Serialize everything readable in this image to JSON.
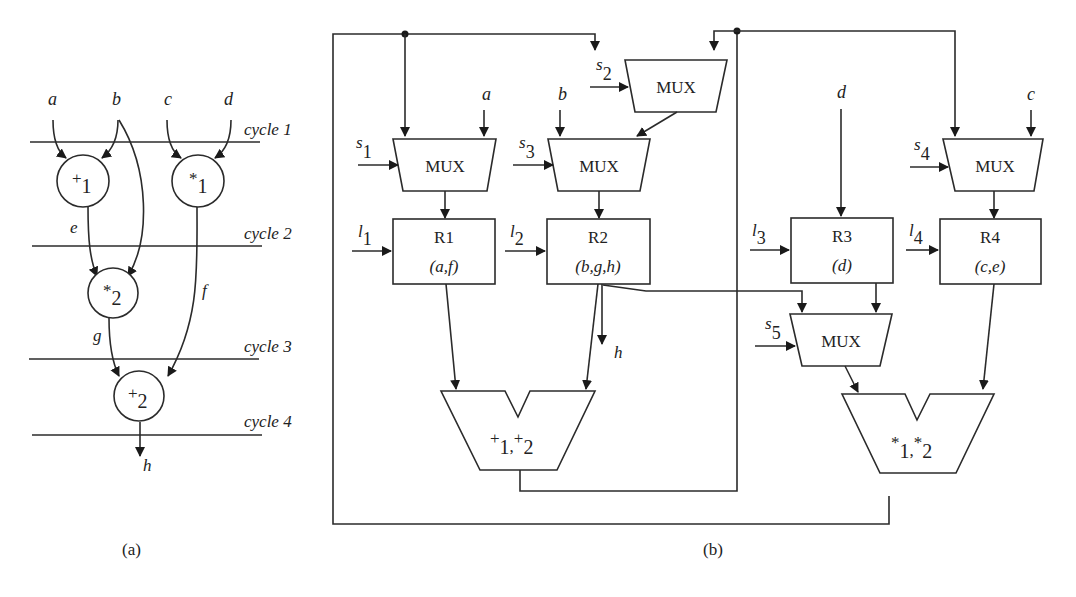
{
  "figure_a": {
    "caption": "(a)",
    "inputs": [
      "a",
      "b",
      "c",
      "d"
    ],
    "cycles": [
      "cycle 1",
      "cycle 2",
      "cycle 3",
      "cycle 4"
    ],
    "nodes": [
      {
        "op": "+",
        "sub": "1"
      },
      {
        "op": "*",
        "sub": "1"
      },
      {
        "op": "*",
        "sub": "2"
      },
      {
        "op": "+",
        "sub": "2"
      }
    ],
    "edge_labels": {
      "e": "e",
      "f": "f",
      "g": "g",
      "h": "h"
    }
  },
  "figure_b": {
    "caption": "(b)",
    "muxes": [
      {
        "label": "MUX",
        "select": "s",
        "select_sub": "1"
      },
      {
        "label": "MUX",
        "select": "s",
        "select_sub": "2"
      },
      {
        "label": "MUX",
        "select": "s",
        "select_sub": "3"
      },
      {
        "label": "MUX",
        "select": "s",
        "select_sub": "4"
      },
      {
        "label": "MUX",
        "select": "s",
        "select_sub": "5"
      }
    ],
    "registers": [
      {
        "name": "R1",
        "contents": "(a,f)",
        "load": "l",
        "load_sub": "1"
      },
      {
        "name": "R2",
        "contents": "(b,g,h)",
        "load": "l",
        "load_sub": "2"
      },
      {
        "name": "R3",
        "contents": "(d)",
        "load": "l",
        "load_sub": "3"
      },
      {
        "name": "R4",
        "contents": "(c,e)",
        "load": "l",
        "load_sub": "4"
      }
    ],
    "alus": [
      {
        "ops": [
          {
            "op": "+",
            "sub": "1"
          },
          {
            "op": "+",
            "sub": "2"
          }
        ]
      },
      {
        "ops": [
          {
            "op": "*",
            "sub": "1"
          },
          {
            "op": "*",
            "sub": "2"
          }
        ]
      }
    ],
    "inputs": {
      "a": "a",
      "b": "b",
      "c": "c",
      "d": "d"
    },
    "output": "h"
  }
}
